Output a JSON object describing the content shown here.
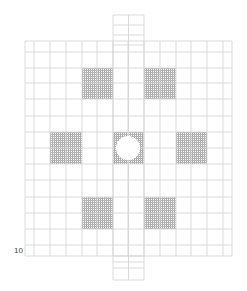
{
  "diagram": {
    "type": "grid-layout",
    "corner_label": "10",
    "colors": {
      "line": "#d2d2d2",
      "hatch": "#9a9a9a",
      "background": "#ffffff"
    },
    "grid": {
      "x_lines": [
        25,
        34,
        50,
        66,
        82,
        97,
        113,
        128,
        144,
        160,
        176,
        191,
        207,
        223,
        232
      ],
      "y_lines": [
        41,
        52,
        68,
        83,
        99,
        116,
        132,
        148,
        164,
        180,
        197,
        213,
        229,
        245,
        256
      ]
    },
    "center_column": {
      "x": 113,
      "width": 31,
      "top": 15,
      "bottom": 280,
      "inner_y": [
        15,
        25,
        35,
        45,
        256,
        262,
        268,
        280
      ]
    },
    "shaded_blocks": [
      {
        "name": "top-left",
        "x": 82,
        "y": 68,
        "w": 31,
        "h": 31
      },
      {
        "name": "top-right",
        "x": 144,
        "y": 68,
        "w": 32,
        "h": 31
      },
      {
        "name": "middle-left",
        "x": 50,
        "y": 132,
        "w": 32,
        "h": 32
      },
      {
        "name": "center",
        "x": 113,
        "y": 132,
        "w": 31,
        "h": 32
      },
      {
        "name": "middle-right",
        "x": 176,
        "y": 132,
        "w": 31,
        "h": 32
      },
      {
        "name": "bottom-left",
        "x": 82,
        "y": 197,
        "w": 31,
        "h": 32
      },
      {
        "name": "bottom-right",
        "x": 144,
        "y": 197,
        "w": 32,
        "h": 32
      }
    ],
    "circle": {
      "cx": 128,
      "cy": 148,
      "r": 12
    }
  }
}
